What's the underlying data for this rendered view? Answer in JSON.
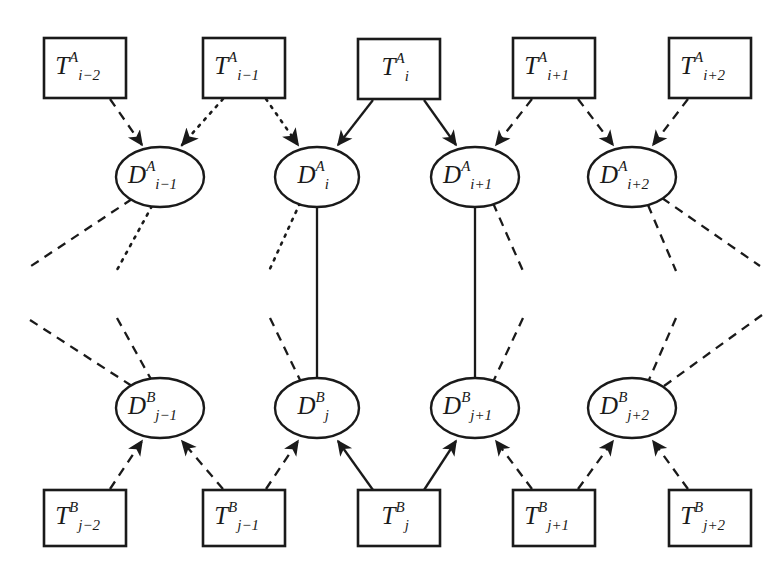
{
  "figure": {
    "background_color": "#ffffff",
    "ink_color": "#1a1a1a",
    "width": 781,
    "height": 580
  },
  "layers": [
    {
      "id": "layer-A",
      "superscript": "A",
      "index_symbol": "i",
      "observation_row": {
        "shape": "rectangle",
        "nodes": [
          {
            "id": "T-A-i-minus-2",
            "base": "T",
            "sup": "A",
            "sub": "i−2",
            "cx": 85,
            "cy": 68,
            "w": 82,
            "h": 60
          },
          {
            "id": "T-A-i-minus-1",
            "base": "T",
            "sup": "A",
            "sub": "i−1",
            "cx": 244,
            "cy": 68,
            "w": 82,
            "h": 60
          },
          {
            "id": "T-A-i",
            "base": "T",
            "sup": "A",
            "sub": "i",
            "cx": 399,
            "cy": 69,
            "w": 82,
            "h": 60
          },
          {
            "id": "T-A-i-plus-1",
            "base": "T",
            "sup": "A",
            "sub": "i+1",
            "cx": 554,
            "cy": 68,
            "w": 82,
            "h": 60
          },
          {
            "id": "T-A-i-plus-2",
            "base": "T",
            "sup": "A",
            "sub": "i+2",
            "cx": 710,
            "cy": 68,
            "w": 82,
            "h": 60
          }
        ]
      },
      "state_row": {
        "shape": "ellipse",
        "nodes": [
          {
            "id": "D-A-i-minus-1",
            "base": "D",
            "sup": "A",
            "sub": "i−1",
            "cx": 160,
            "cy": 177,
            "rx": 44,
            "ry": 30
          },
          {
            "id": "D-A-i",
            "base": "D",
            "sup": "A",
            "sub": "i",
            "cx": 317,
            "cy": 177,
            "rx": 42,
            "ry": 30
          },
          {
            "id": "D-A-i-plus-1",
            "base": "D",
            "sup": "A",
            "sub": "i+1",
            "cx": 475,
            "cy": 177,
            "rx": 44,
            "ry": 30
          },
          {
            "id": "D-A-i-plus-2",
            "base": "D",
            "sup": "A",
            "sub": "i+2",
            "cx": 632,
            "cy": 177,
            "rx": 44,
            "ry": 30
          }
        ]
      }
    },
    {
      "id": "layer-B",
      "superscript": "B",
      "index_symbol": "j",
      "state_row": {
        "shape": "ellipse",
        "nodes": [
          {
            "id": "D-B-j-minus-1",
            "base": "D",
            "sup": "B",
            "sub": "j−1",
            "cx": 160,
            "cy": 408,
            "rx": 44,
            "ry": 30
          },
          {
            "id": "D-B-j",
            "base": "D",
            "sup": "B",
            "sub": "j",
            "cx": 317,
            "cy": 408,
            "rx": 42,
            "ry": 30
          },
          {
            "id": "D-B-j-plus-1",
            "base": "D",
            "sup": "B",
            "sub": "j+1",
            "cx": 475,
            "cy": 408,
            "rx": 44,
            "ry": 30
          },
          {
            "id": "D-B-j-plus-2",
            "base": "D",
            "sup": "B",
            "sub": "j+2",
            "cx": 632,
            "cy": 408,
            "rx": 44,
            "ry": 30
          }
        ]
      },
      "observation_row": {
        "shape": "rectangle",
        "nodes": [
          {
            "id": "T-B-j-minus-2",
            "base": "T",
            "sup": "B",
            "sub": "j−2",
            "cx": 85,
            "cy": 518,
            "w": 82,
            "h": 56
          },
          {
            "id": "T-B-j-minus-1",
            "base": "T",
            "sup": "B",
            "sub": "j−1",
            "cx": 244,
            "cy": 518,
            "w": 82,
            "h": 56
          },
          {
            "id": "T-B-j",
            "base": "T",
            "sup": "B",
            "sub": "j",
            "cx": 399,
            "cy": 518,
            "w": 82,
            "h": 56
          },
          {
            "id": "T-B-j-plus-1",
            "base": "T",
            "sup": "B",
            "sub": "j+1",
            "cx": 554,
            "cy": 518,
            "w": 82,
            "h": 56
          },
          {
            "id": "T-B-j-plus-2",
            "base": "T",
            "sup": "B",
            "sub": "j+2",
            "cx": 710,
            "cy": 518,
            "w": 82,
            "h": 56
          }
        ]
      }
    }
  ],
  "line_styles": {
    "solid": "solid",
    "dashed": "dashed",
    "dotted": "dotted"
  },
  "edges": {
    "observation_to_state_A": [
      {
        "id": "e-TAim2-DAim1",
        "from": "T-A-i-minus-2",
        "to": "D-A-i-minus-1",
        "style": "dashed",
        "arrow": true,
        "x1": 110,
        "y1": 99,
        "x2": 142,
        "y2": 145
      },
      {
        "id": "e-TAim1-DAim1",
        "from": "T-A-i-minus-1",
        "to": "D-A-i-minus-1",
        "style": "dotted",
        "arrow": true,
        "x1": 223,
        "y1": 99,
        "x2": 182,
        "y2": 145
      },
      {
        "id": "e-TAim1-DAi",
        "from": "T-A-i-minus-1",
        "to": "D-A-i",
        "style": "dotted",
        "arrow": true,
        "x1": 266,
        "y1": 99,
        "x2": 298,
        "y2": 145
      },
      {
        "id": "e-TAi-DAi",
        "from": "T-A-i",
        "to": "D-A-i",
        "style": "solid",
        "arrow": true,
        "x1": 373,
        "y1": 100,
        "x2": 338,
        "y2": 145
      },
      {
        "id": "e-TAi-DAip1",
        "from": "T-A-i",
        "to": "D-A-i-plus-1",
        "style": "solid",
        "arrow": true,
        "x1": 424,
        "y1": 100,
        "x2": 456,
        "y2": 145
      },
      {
        "id": "e-TAip1-DAip1",
        "from": "T-A-i-plus-1",
        "to": "D-A-i-plus-1",
        "style": "dashed",
        "arrow": true,
        "x1": 532,
        "y1": 99,
        "x2": 496,
        "y2": 145
      },
      {
        "id": "e-TAip1-DAip2",
        "from": "T-A-i-plus-1",
        "to": "D-A-i-plus-2",
        "style": "dashed",
        "arrow": true,
        "x1": 578,
        "y1": 99,
        "x2": 613,
        "y2": 145
      },
      {
        "id": "e-TAip2-DAip2",
        "from": "T-A-i-plus-2",
        "to": "D-A-i-plus-2",
        "style": "dashed",
        "arrow": true,
        "x1": 688,
        "y1": 99,
        "x2": 653,
        "y2": 145
      }
    ],
    "observation_to_state_B": [
      {
        "id": "e-TBjm2-DBjm1",
        "from": "T-B-j-minus-2",
        "to": "D-B-j-minus-1",
        "style": "dashed",
        "arrow": true,
        "x1": 110,
        "y1": 489,
        "x2": 142,
        "y2": 441
      },
      {
        "id": "e-TBjm1-DBjm1",
        "from": "T-B-j-minus-1",
        "to": "D-B-j-minus-1",
        "style": "dashed",
        "arrow": true,
        "x1": 223,
        "y1": 489,
        "x2": 182,
        "y2": 441
      },
      {
        "id": "e-TBjm1-DBj",
        "from": "T-B-j-minus-1",
        "to": "D-B-j",
        "style": "dashed",
        "arrow": true,
        "x1": 266,
        "y1": 489,
        "x2": 298,
        "y2": 441
      },
      {
        "id": "e-TBj-DBj",
        "from": "T-B-j",
        "to": "D-B-j",
        "style": "solid",
        "arrow": true,
        "x1": 373,
        "y1": 490,
        "x2": 338,
        "y2": 441
      },
      {
        "id": "e-TBj-DBjp1",
        "from": "T-B-j",
        "to": "D-B-j-plus-1",
        "style": "solid",
        "arrow": true,
        "x1": 424,
        "y1": 490,
        "x2": 456,
        "y2": 441
      },
      {
        "id": "e-TBjp1-DBjp1",
        "from": "T-B-j-plus-1",
        "to": "D-B-j-plus-1",
        "style": "dashed",
        "arrow": true,
        "x1": 532,
        "y1": 489,
        "x2": 496,
        "y2": 441
      },
      {
        "id": "e-TBjp1-DBjp2",
        "from": "T-B-j-plus-1",
        "to": "D-B-j-plus-2",
        "style": "dashed",
        "arrow": true,
        "x1": 578,
        "y1": 489,
        "x2": 613,
        "y2": 441
      },
      {
        "id": "e-TBjp2-DBjp2",
        "from": "T-B-j-plus-2",
        "to": "D-B-j-plus-2",
        "style": "dashed",
        "arrow": true,
        "x1": 688,
        "y1": 489,
        "x2": 653,
        "y2": 441
      }
    ],
    "cross_layer": [
      {
        "id": "e-DAi-DBj",
        "from": "D-A-i",
        "to": "D-B-j",
        "style": "solid",
        "arrow": false,
        "x1": 317,
        "y1": 207,
        "x2": 317,
        "y2": 378
      },
      {
        "id": "e-DAip1-DBjp1",
        "from": "D-A-i-plus-1",
        "to": "D-B-j-plus-1",
        "style": "solid",
        "arrow": false,
        "x1": 475,
        "y1": 207,
        "x2": 475,
        "y2": 378
      }
    ],
    "dangling_from_A": [
      {
        "id": "d-DAim1-left",
        "from": "D-A-i-minus-1",
        "style": "dashed",
        "x1": 132,
        "y1": 199,
        "x2": 28,
        "y2": 268
      },
      {
        "id": "d-DAim1-down",
        "from": "D-A-i-minus-1",
        "style": "dotted",
        "x1": 152,
        "y1": 206,
        "x2": 117,
        "y2": 270
      },
      {
        "id": "d-DAi-left",
        "from": "D-A-i",
        "style": "dotted",
        "x1": 300,
        "y1": 203,
        "x2": 269,
        "y2": 271
      },
      {
        "id": "d-DAip1-right",
        "from": "D-A-i-plus-1",
        "style": "dashed",
        "x1": 493,
        "y1": 203,
        "x2": 523,
        "y2": 271
      },
      {
        "id": "d-DAip2-down",
        "from": "D-A-i-plus-2",
        "style": "dashed",
        "x1": 648,
        "y1": 205,
        "x2": 676,
        "y2": 271
      },
      {
        "id": "d-DAip2-right",
        "from": "D-A-i-plus-2",
        "style": "dashed",
        "x1": 662,
        "y1": 198,
        "x2": 760,
        "y2": 266
      }
    ],
    "dangling_to_B": [
      {
        "id": "d-DBjm1-left",
        "to": "D-B-j-minus-1",
        "style": "dashed",
        "x1": 30,
        "y1": 320,
        "x2": 135,
        "y2": 388
      },
      {
        "id": "d-DBjm1-up",
        "to": "D-B-j-minus-1",
        "style": "dashed",
        "x1": 117,
        "y1": 318,
        "x2": 152,
        "y2": 381
      },
      {
        "id": "d-DBj-left",
        "to": "D-B-j",
        "style": "dashed",
        "x1": 270,
        "y1": 318,
        "x2": 301,
        "y2": 382
      },
      {
        "id": "d-DBjp1-right",
        "to": "D-B-j-plus-1",
        "style": "dashed",
        "x1": 523,
        "y1": 318,
        "x2": 493,
        "y2": 382
      },
      {
        "id": "d-DBjp2-up",
        "to": "D-B-j-plus-2",
        "style": "dashed",
        "x1": 676,
        "y1": 318,
        "x2": 648,
        "y2": 382
      },
      {
        "id": "d-DBjp2-right",
        "to": "D-B-j-plus-2",
        "style": "dashed",
        "x1": 762,
        "y1": 315,
        "x2": 664,
        "y2": 386
      }
    ]
  }
}
